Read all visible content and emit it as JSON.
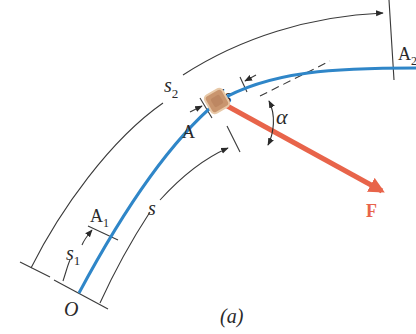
{
  "figure": {
    "caption": "(a)",
    "colors": {
      "path": "#2f86c8",
      "force": "#e8644a",
      "block_fill": "#c9956e",
      "block_stroke": "#e8c9a8",
      "line": "#3a3a3a"
    },
    "labels": {
      "origin": "O",
      "point_a1": "A",
      "point_a1_sub": "1",
      "point_a": "A",
      "point_a2": "A",
      "point_a2_sub": "2",
      "s2": "s",
      "s2_sub": "2",
      "s1": "s",
      "s1_sub": "1",
      "s": "s",
      "ds": "ds",
      "alpha": "α",
      "force": "F"
    }
  }
}
